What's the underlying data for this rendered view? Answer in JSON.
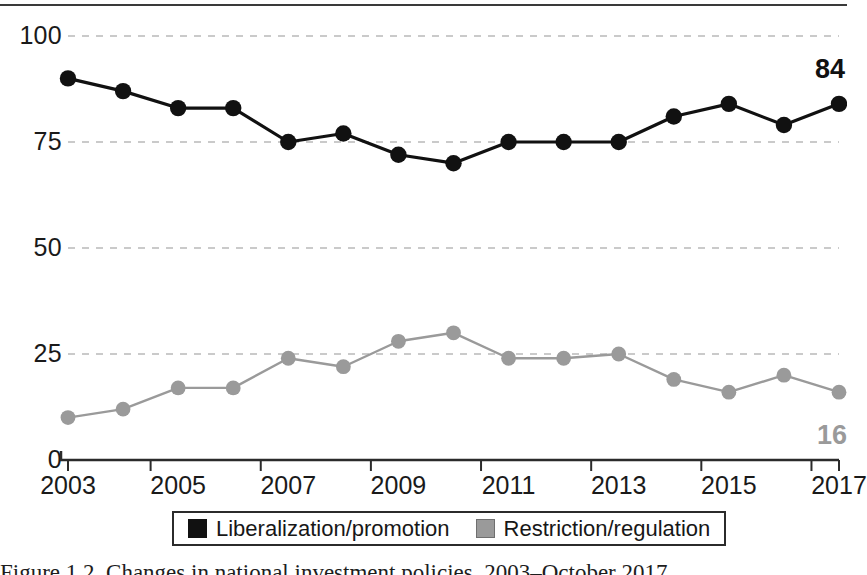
{
  "chart_data": {
    "type": "line",
    "title": "",
    "xlabel": "",
    "ylabel": "",
    "grid": true,
    "legend_position": "bottom",
    "ylim": [
      0,
      100
    ],
    "yticks": [
      0,
      25,
      50,
      75,
      100
    ],
    "ytick_labels": [
      "0",
      "25",
      "50",
      "75",
      "100"
    ],
    "categories": [
      2003,
      2004,
      2005,
      2006,
      2007,
      2008,
      2009,
      2010,
      2011,
      2012,
      2013,
      2014,
      2015,
      2016,
      2017
    ],
    "xtick_labels": [
      "2003",
      "2005",
      "2007",
      "2009",
      "2011",
      "2013",
      "2015",
      "2017"
    ],
    "xtick_values": [
      2003,
      2005,
      2007,
      2009,
      2011,
      2013,
      2015,
      2017
    ],
    "series": [
      {
        "name": "Liberalization/promotion",
        "color": "#111111",
        "values": [
          90,
          87,
          83,
          83,
          75,
          77,
          72,
          70,
          75,
          75,
          75,
          81,
          84,
          79,
          84
        ],
        "end_label": "84"
      },
      {
        "name": "Restriction/regulation",
        "color": "#9a9a9a",
        "values": [
          10,
          12,
          17,
          17,
          24,
          22,
          28,
          30,
          24,
          24,
          25,
          19,
          16,
          20,
          16
        ],
        "end_label": "16"
      }
    ],
    "annotations": [
      {
        "text": "84",
        "series": "Liberalization/promotion",
        "color": "#111111"
      },
      {
        "text": "16",
        "series": "Restriction/regulation",
        "color": "#9a9a9a"
      }
    ]
  },
  "legend": {
    "entries": [
      {
        "label": "Liberalization/promotion",
        "swatch": "dark"
      },
      {
        "label": "Restriction/regulation",
        "swatch": "gray"
      }
    ]
  },
  "annotations": {
    "top_value": "84",
    "bottom_value": "16"
  },
  "caption": {
    "text": "Figure 1.2. Changes in national investment policies, 2003–October 2017"
  }
}
